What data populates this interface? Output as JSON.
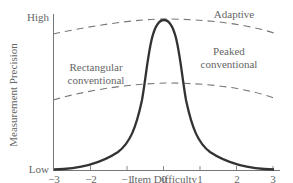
{
  "chart_data": {
    "type": "line",
    "title": "",
    "xlabel": "Item Difficulty",
    "ylabel": "Measurement Precision",
    "x_ticks": [
      -3,
      -2,
      -1,
      0,
      1,
      2,
      3
    ],
    "x_tick_labels": [
      "−3",
      "−2",
      "−1",
      "0",
      "1",
      "2",
      "3"
    ],
    "y_tick_labels": [
      "Low",
      "High"
    ],
    "xlim": [
      -3,
      3
    ],
    "ylim": [
      0,
      1
    ],
    "grid": false,
    "legend": "none",
    "series": [
      {
        "name": "Peaked conventional",
        "style": "solid",
        "x": [
          -3,
          -2.5,
          -2,
          -1.5,
          -1,
          -0.75,
          -0.5,
          -0.25,
          0,
          0.25,
          0.5,
          0.75,
          1,
          1.5,
          2,
          2.5,
          3
        ],
        "values": [
          0.01,
          0.04,
          0.09,
          0.18,
          0.34,
          0.48,
          0.68,
          0.9,
          0.98,
          0.9,
          0.68,
          0.48,
          0.34,
          0.18,
          0.09,
          0.04,
          0.01
        ]
      },
      {
        "name": "Adaptive",
        "style": "dashed",
        "x": [
          -3,
          -2,
          -1,
          0,
          1,
          2,
          3
        ],
        "values": [
          0.9,
          0.95,
          0.98,
          0.99,
          0.97,
          0.94,
          0.9
        ]
      },
      {
        "name": "Rectangular conventional",
        "style": "dashed",
        "x": [
          -3,
          -2,
          -1,
          0,
          1,
          2,
          3
        ],
        "values": [
          0.46,
          0.53,
          0.57,
          0.58,
          0.57,
          0.52,
          0.47
        ]
      }
    ],
    "annotations": [
      {
        "text": "Adaptive",
        "x": 1.9,
        "y": 0.99
      },
      {
        "text": "Rectangular conventional",
        "x": -1.9,
        "y": 0.72
      },
      {
        "text": "Peaked conventional",
        "x": 2.0,
        "y": 0.76
      }
    ]
  },
  "labels": {
    "y_high": "High",
    "y_low": "Low",
    "ylabel": "Measurement Precision",
    "xlabel": "Item Difficulty",
    "adaptive": "Adaptive",
    "rect_line1": "Rectangular",
    "rect_line2": "conventional",
    "peaked_line1": "Peaked",
    "peaked_line2": "conventional",
    "ticks": [
      "−3",
      "−2",
      "−1",
      "0",
      "1",
      "2",
      "3"
    ]
  }
}
